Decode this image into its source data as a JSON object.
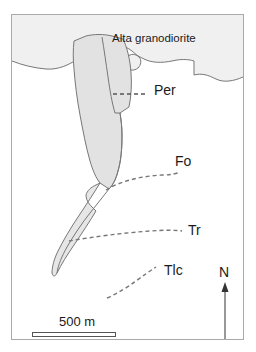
{
  "figure": {
    "type": "geologic-map",
    "background_color": "#ffffff",
    "frame_color": "#aaaaaa"
  },
  "units": {
    "granodiorite": {
      "label": "Alta granodiorite",
      "fill_color": "#f0f0f0",
      "outline_color": "#777777"
    },
    "central_body": {
      "fill_color": "#e2e2e2",
      "outline_color": "#777777"
    },
    "lower_sliver": {
      "fill_color": "#e6e6e6",
      "outline_color": "#777777"
    }
  },
  "contacts": [
    {
      "label": "Per",
      "style": "dashed",
      "color": "#555555"
    },
    {
      "label": "Fo",
      "style": "dashed",
      "color": "#777777"
    },
    {
      "label": "Tr",
      "style": "dashed",
      "color": "#777777"
    },
    {
      "label": "Tlc",
      "style": "dashed",
      "color": "#777777"
    }
  ],
  "labels": {
    "granodiorite": "Alta granodiorite",
    "per": "Per",
    "fo": "Fo",
    "tr": "Tr",
    "tlc": "Tlc"
  },
  "north_arrow": {
    "label": "N",
    "color": "#333333"
  },
  "scale_bar": {
    "label": "500 m",
    "value": 500,
    "unit": "m",
    "bar_color": "#555555"
  }
}
